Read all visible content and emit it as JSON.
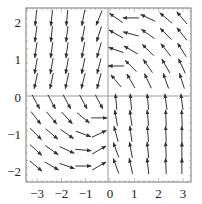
{
  "chart_data": {
    "type": "vector_field",
    "title": "",
    "xlabel": "",
    "ylabel": "",
    "xlim": [
      -3.45,
      3.35
    ],
    "ylim": [
      -2.3,
      2.4
    ],
    "grid": false,
    "axes_lines": true,
    "x_ticks": [
      {
        "value": -3,
        "label": "−3"
      },
      {
        "value": -2,
        "label": "−2"
      },
      {
        "value": -1,
        "label": "−1"
      },
      {
        "value": 0,
        "label": "0"
      },
      {
        "value": 1,
        "label": "1"
      },
      {
        "value": 2,
        "label": "2"
      },
      {
        "value": 3,
        "label": "3"
      }
    ],
    "y_ticks": [
      {
        "value": 2,
        "label": "2"
      },
      {
        "value": 1,
        "label": "1"
      },
      {
        "value": 0,
        "label": "0"
      },
      {
        "value": -1,
        "label": "−1"
      },
      {
        "value": -2,
        "label": "−2"
      }
    ],
    "arrow_color": "#333333",
    "grid_x": [
      -3.05,
      -2.4,
      -1.77,
      -1.1,
      -0.45,
      0.25,
      0.86,
      1.56,
      2.3,
      2.96
    ],
    "grid_y": [
      2.12,
      1.69,
      1.26,
      0.83,
      0.43,
      -0.13,
      -0.56,
      -0.99,
      -1.42,
      -1.85
    ],
    "arrow_angles_deg_screen": [
      [
        95,
        96,
        95,
        100,
        112,
        215,
        180,
        205,
        220,
        230
      ],
      [
        97,
        96,
        97,
        100,
        108,
        210,
        195,
        215,
        225,
        232
      ],
      [
        98,
        98,
        98,
        100,
        106,
        200,
        210,
        225,
        232,
        238
      ],
      [
        100,
        100,
        100,
        102,
        104,
        180,
        225,
        235,
        240,
        245
      ],
      [
        102,
        102,
        102,
        104,
        105,
        230,
        240,
        245,
        250,
        252
      ],
      [
        62,
        62,
        62,
        62,
        62,
        265,
        265,
        265,
        262,
        262
      ],
      [
        52,
        50,
        48,
        40,
        0,
        260,
        262,
        265,
        268,
        268
      ],
      [
        45,
        40,
        35,
        20,
        335,
        255,
        262,
        266,
        268,
        270
      ],
      [
        42,
        35,
        25,
        5,
        330,
        250,
        260,
        265,
        268,
        270
      ],
      [
        40,
        30,
        20,
        0,
        330,
        250,
        258,
        264,
        268,
        270
      ]
    ],
    "arrow_length_px": 16
  }
}
